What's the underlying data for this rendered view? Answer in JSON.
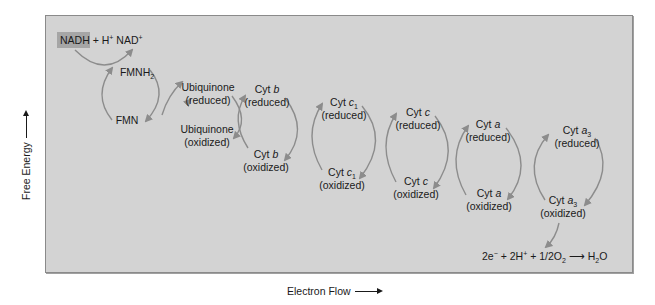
{
  "diagram": {
    "y_axis_label": "Free Energy",
    "x_axis_label": "Electron Flow",
    "top_equation": {
      "highlighted": "NADH",
      "rest_1": " + H",
      "sup_1": "+",
      "rest_2": " NAD",
      "sup_2": "+"
    },
    "carriers": [
      {
        "name": "FMNH",
        "sub": "2",
        "state": ""
      },
      {
        "name": "FMN",
        "sub": "",
        "state": ""
      },
      {
        "name": "Ubiquinone",
        "state": "(reduced)"
      },
      {
        "name": "Ubiquinone",
        "state": "(oxidized)"
      },
      {
        "prefix": "Cyt ",
        "italic": "b",
        "sub": "",
        "state": "(reduced)"
      },
      {
        "prefix": "Cyt ",
        "italic": "b",
        "sub": "",
        "state": "(oxidized)"
      },
      {
        "prefix": "Cyt ",
        "italic": "c",
        "sub": "1",
        "state": "(reduced)"
      },
      {
        "prefix": "Cyt ",
        "italic": "c",
        "sub": "1",
        "state": "(oxidized)"
      },
      {
        "prefix": "Cyt ",
        "italic": "c",
        "sub": "",
        "state": "(reduced)"
      },
      {
        "prefix": "Cyt ",
        "italic": "c",
        "sub": "",
        "state": "(oxidized)"
      },
      {
        "prefix": "Cyt ",
        "italic": "a",
        "sub": "",
        "state": "(reduced)"
      },
      {
        "prefix": "Cyt ",
        "italic": "a",
        "sub": "",
        "state": "(oxidized)"
      },
      {
        "prefix": "Cyt ",
        "italic": "a",
        "sub": "3",
        "state": "(reduced)"
      },
      {
        "prefix": "Cyt ",
        "italic": "a",
        "sub": "3",
        "state": "(oxidized)"
      }
    ],
    "bottom_equation": {
      "p1": "2e",
      "sup1": "−",
      "p2": " + 2H",
      "sup2": "+",
      "p3": " + 1/2O",
      "sub3": "2",
      "arrow": " ⟶ ",
      "p4": "H",
      "sub4": "2",
      "p5": "O"
    },
    "colors": {
      "panel": "#d3d3d3",
      "highlight": "#a6a6a6",
      "arrow": "#8c8c8c",
      "text": "#1a1a1a"
    }
  }
}
